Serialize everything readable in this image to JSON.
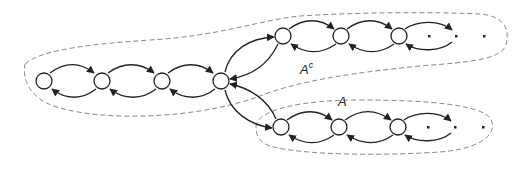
{
  "diagram": {
    "type": "state-transition-graph",
    "labels": {
      "complement_set": "A",
      "complement_sup": "c",
      "set": "A"
    },
    "colors": {
      "stroke": "#222222",
      "dashed_outline": "#888888",
      "background": "#ffffff"
    },
    "rows": [
      {
        "name": "left-chain",
        "node_count": 4
      },
      {
        "name": "upper-chain",
        "node_count": 3,
        "trailing_dots": 3,
        "region": "A^c"
      },
      {
        "name": "lower-chain",
        "node_count": 3,
        "trailing_dots": 3,
        "region": "A"
      }
    ]
  }
}
